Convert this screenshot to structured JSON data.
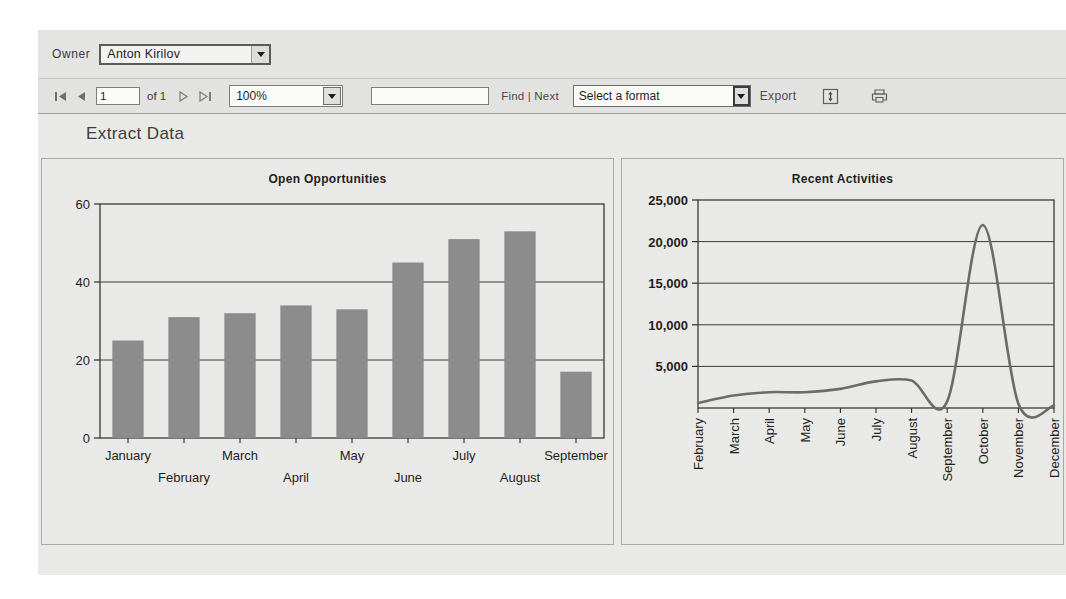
{
  "parameters": {
    "owner_label": "Owner",
    "owner_value": "Anton Kirilov"
  },
  "toolbar": {
    "first_page_icon": "first-page-icon",
    "prev_page_icon": "previous-page-icon",
    "page_number": "1",
    "of_text": "of 1",
    "next_page_icon": "next-page-icon",
    "last_page_icon": "last-page-icon",
    "zoom_value": "100%",
    "find_placeholder": "",
    "find_value": "",
    "find_label": "Find",
    "find_separator": "|",
    "next_label": "Next",
    "format_value": "Select a format",
    "export_label": "Export",
    "refresh_icon": "refresh-icon",
    "print_icon": "print-icon"
  },
  "report": {
    "title": "Extract Data"
  },
  "chart_data": [
    {
      "type": "bar",
      "title": "Open Opportunities",
      "xlabel": "",
      "ylabel": "",
      "categories": [
        "January",
        "February",
        "March",
        "April",
        "May",
        "June",
        "July",
        "August",
        "September"
      ],
      "values": [
        25,
        31,
        32,
        34,
        33,
        45,
        51,
        53,
        17
      ],
      "ylim": [
        0,
        60
      ],
      "yticks": [
        0,
        20,
        40,
        60
      ],
      "ytick_labels": [
        "0",
        "20",
        "40",
        "60"
      ],
      "grid": true,
      "legend": "none",
      "bar_color": "#8c8c8c"
    },
    {
      "type": "line",
      "title": "Recent Activities",
      "xlabel": "",
      "ylabel": "",
      "categories": [
        "February",
        "March",
        "April",
        "May",
        "June",
        "July",
        "August",
        "September",
        "October",
        "November",
        "December"
      ],
      "values": [
        600,
        1500,
        1900,
        1900,
        2300,
        3200,
        3300,
        800,
        22000,
        500,
        300
      ],
      "ylim": [
        0,
        25000
      ],
      "yticks": [
        5000,
        10000,
        15000,
        20000,
        25000
      ],
      "ytick_labels": [
        "5,000",
        "10,000",
        "15,000",
        "20,000",
        "25,000"
      ],
      "grid": true,
      "legend": "none",
      "line_color": "#6b6b6b"
    }
  ]
}
